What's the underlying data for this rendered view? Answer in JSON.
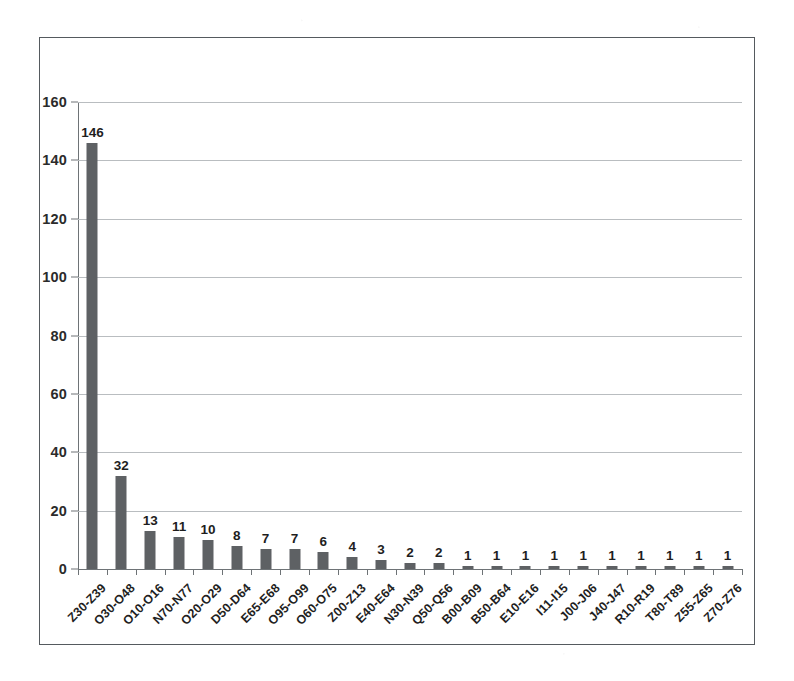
{
  "chart_data": {
    "type": "bar",
    "title": "",
    "subtitle": "",
    "xlabel": "",
    "ylabel": "",
    "ylim": [
      0,
      160
    ],
    "y_ticks": [
      0,
      20,
      40,
      60,
      80,
      100,
      120,
      140,
      160
    ],
    "grid": true,
    "legend": false,
    "legend_position": "none",
    "show_data_labels": true,
    "bar_color": "#5e6164",
    "gridline_color": "#b9bdc0",
    "axis_color": "#6e7376",
    "plot_background": "#ffffff",
    "categories": [
      "Z30-Z39",
      "O30-O48",
      "O10-O16",
      "N70-N77",
      "O20-O29",
      "D50-D64",
      "E65-E68",
      "O95-O99",
      "O60-O75",
      "Z00-Z13",
      "E40-E64",
      "N30-N39",
      "Q50-Q56",
      "B00-B09",
      "B50-B64",
      "E10-E16",
      "I11-I15",
      "J00-J06",
      "J40-J47",
      "R10-R19",
      "T80-T89",
      "Z55-Z65",
      "Z70-Z76"
    ],
    "values": [
      146,
      32,
      13,
      11,
      10,
      8,
      7,
      7,
      6,
      4,
      3,
      2,
      2,
      1,
      1,
      1,
      1,
      1,
      1,
      1,
      1,
      1,
      1
    ],
    "value_labels": [
      "146",
      "32",
      "13",
      "11",
      "10",
      "8",
      "7",
      "7",
      "6",
      "4",
      "3",
      "2",
      "2",
      "1",
      "1",
      "1",
      "1",
      "1",
      "1",
      "1",
      "1",
      "1",
      "1"
    ],
    "y_tick_labels": [
      "0",
      "20",
      "40",
      "60",
      "80",
      "100",
      "120",
      "140",
      "160"
    ]
  }
}
